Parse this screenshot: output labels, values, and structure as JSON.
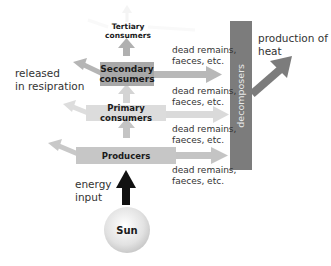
{
  "levels": {
    "tertiary": "Tertiary consumers",
    "secondary_line1": "Secondary",
    "secondary_line2": "consumers",
    "primary": "Primary consumers",
    "producers": "Producers"
  },
  "decomposers": "decomposers",
  "sun": "Sun",
  "labels": {
    "released_line1": "released",
    "released_line2": "in resipration",
    "energy_line1": "energy",
    "energy_line2": "input",
    "heat_line1": "production of",
    "heat_line2": "heat",
    "dead_line1": "dead remains,",
    "dead_line2": "faeces, etc."
  },
  "colors": {
    "box": "#c8c8c8",
    "box_dark": "#9e9e9e",
    "decomposers": "#7a7a7a",
    "arrow_light": "#cfcfcf",
    "arrow_mid": "#b5b5b5",
    "energy_arrow": "#111111",
    "sun": "#e6e6e6"
  }
}
